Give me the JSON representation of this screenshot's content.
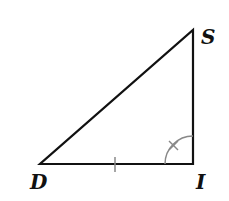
{
  "diagram": {
    "type": "right-triangle",
    "vertices": [
      {
        "label": "D",
        "x": 40,
        "y": 164
      },
      {
        "label": "I",
        "x": 193,
        "y": 164
      },
      {
        "label": "S",
        "x": 193,
        "y": 30
      }
    ],
    "marks": {
      "side_tick": "DI",
      "angle_mark": "I (arc with cross)"
    },
    "colors": {
      "stroke": "#111111",
      "mark": "#888888"
    }
  }
}
